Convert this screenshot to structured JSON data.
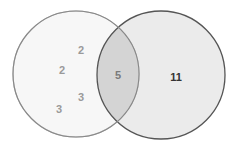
{
  "diagram": {
    "type": "venn",
    "sets": [
      {
        "name": "left-set",
        "fill": "#f7f7f7",
        "stroke": "#b8b8b8",
        "values": [
          {
            "label": "2",
            "x": 81,
            "y": 51
          },
          {
            "label": "2",
            "x": 62,
            "y": 71
          },
          {
            "label": "3",
            "x": 81,
            "y": 98
          },
          {
            "label": "3",
            "x": 59,
            "y": 110
          }
        ]
      },
      {
        "name": "right-set",
        "fill": "#ebebeb",
        "stroke": "#555555",
        "values": [
          {
            "label": "11",
            "x": 176,
            "y": 78
          }
        ]
      }
    ],
    "intersection": {
      "fill": "#d4d4d4",
      "stroke": "#7a7a7a",
      "label": "5",
      "x": 118,
      "y": 76
    }
  }
}
